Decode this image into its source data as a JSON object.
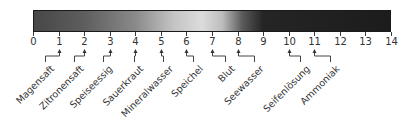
{
  "scale": {
    "min": 0,
    "max": 14,
    "ticks": [
      "0",
      "1",
      "2",
      "3",
      "4",
      "5",
      "6",
      "7",
      "8",
      "9",
      "10",
      "11",
      "12",
      "13",
      "14"
    ],
    "gradient_stops": [
      {
        "ph": 0,
        "color": "#474747"
      },
      {
        "ph": 2,
        "color": "#5e5e5e"
      },
      {
        "ph": 4,
        "color": "#8a8a8a"
      },
      {
        "ph": 5.5,
        "color": "#c4c4c4"
      },
      {
        "ph": 6.6,
        "color": "#dcdcdc"
      },
      {
        "ph": 7.4,
        "color": "#bdbdbd"
      },
      {
        "ph": 8.2,
        "color": "#5a5a5a"
      },
      {
        "ph": 9,
        "color": "#252525"
      },
      {
        "ph": 14,
        "color": "#1c1c1c"
      }
    ]
  },
  "samples": [
    {
      "label": "Magensaft",
      "ph": 1,
      "jog_x": 45
    },
    {
      "label": "Zitronensaft",
      "ph": 2,
      "jog_x": 74
    },
    {
      "label": "Speiseessig",
      "ph": 3,
      "jog_x": 103
    },
    {
      "label": "Sauerkraut",
      "ph": 4,
      "jog_x": 134
    },
    {
      "label": "Mineralwasser",
      "ph": 5,
      "jog_x": 163
    },
    {
      "label": "Speichel",
      "ph": 6,
      "jog_x": 193
    },
    {
      "label": "Blut",
      "ph": 7,
      "jog_x": 225
    },
    {
      "label": "Seewasser",
      "ph": 8,
      "jog_x": 254
    },
    {
      "label": "Seifenlösung",
      "ph": 10,
      "jog_x": 300
    },
    {
      "label": "Ammoniak",
      "ph": 11,
      "jog_x": 330
    }
  ]
}
